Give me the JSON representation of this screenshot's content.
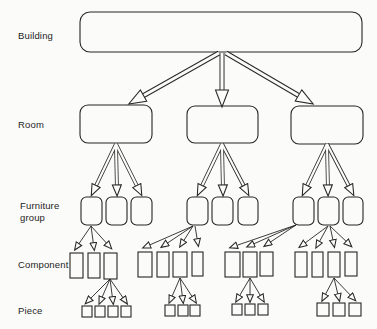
{
  "page": {
    "paper_color": "#fbfbf9",
    "ink_color": "#262626",
    "width": 377,
    "height": 329
  },
  "labels": {
    "building": "Building",
    "room": "Room",
    "furniture_group": "Furniture group",
    "component": "Component",
    "piece": "Piece"
  },
  "structure": {
    "levels": [
      "Building",
      "Room",
      "Furniture group",
      "Component",
      "Piece"
    ],
    "rooms_per_building": 3,
    "furniture_groups_per_room": 3,
    "component_groups": [
      {
        "parent": "furniture-box-1",
        "component_count": 3
      },
      {
        "parent": "furniture-box-4",
        "component_count": 4
      },
      {
        "parent": "furniture-box-7",
        "component_count": 3
      },
      {
        "parent": "furniture-box-8",
        "component_count": 4
      }
    ],
    "piece_groups": [
      {
        "parent": "component-box-1-3",
        "piece_count": 4
      },
      {
        "parent": "component-box-2-3",
        "piece_count": 3
      },
      {
        "parent": "component-box-3-2",
        "piece_count": 3
      },
      {
        "parent": "component-box-4-3",
        "piece_count": 3
      }
    ]
  },
  "diagram": {
    "boxes": [
      {
        "name": "building-box",
        "x": 80,
        "y": 12,
        "w": 282,
        "h": 40,
        "rx": 10
      },
      {
        "name": "room-box-1",
        "x": 80,
        "y": 105,
        "w": 72,
        "h": 38,
        "rx": 8
      },
      {
        "name": "room-box-2",
        "x": 187,
        "y": 106,
        "w": 71,
        "h": 37,
        "rx": 8
      },
      {
        "name": "room-box-3",
        "x": 291,
        "y": 106,
        "w": 72,
        "h": 38,
        "rx": 8
      },
      {
        "name": "furniture-box-1",
        "x": 81,
        "y": 197,
        "w": 21,
        "h": 28,
        "rx": 5.5
      },
      {
        "name": "furniture-box-2",
        "x": 106,
        "y": 197,
        "w": 21,
        "h": 28,
        "rx": 5.5
      },
      {
        "name": "furniture-box-3",
        "x": 131,
        "y": 197,
        "w": 21,
        "h": 28,
        "rx": 5.5
      },
      {
        "name": "furniture-box-4",
        "x": 187,
        "y": 197,
        "w": 21,
        "h": 28,
        "rx": 5.5
      },
      {
        "name": "furniture-box-5",
        "x": 212,
        "y": 197,
        "w": 21,
        "h": 28,
        "rx": 5.5
      },
      {
        "name": "furniture-box-6",
        "x": 238,
        "y": 197,
        "w": 20,
        "h": 28,
        "rx": 5.5
      },
      {
        "name": "furniture-box-7",
        "x": 293,
        "y": 197,
        "w": 21,
        "h": 28,
        "rx": 5.5
      },
      {
        "name": "furniture-box-8",
        "x": 318,
        "y": 197,
        "w": 21,
        "h": 28,
        "rx": 5.5
      },
      {
        "name": "furniture-box-9",
        "x": 343,
        "y": 197,
        "w": 20,
        "h": 28,
        "rx": 5.5
      },
      {
        "name": "component-box-1-1",
        "x": 70,
        "y": 253,
        "w": 13,
        "h": 25,
        "rx": 0
      },
      {
        "name": "component-box-1-2",
        "x": 88,
        "y": 253,
        "w": 12,
        "h": 25,
        "rx": 0
      },
      {
        "name": "component-box-1-3",
        "x": 104,
        "y": 253,
        "w": 13,
        "h": 26,
        "rx": 0
      },
      {
        "name": "component-box-2-1",
        "x": 138,
        "y": 252,
        "w": 14,
        "h": 25,
        "rx": 0
      },
      {
        "name": "component-box-2-2",
        "x": 157,
        "y": 252,
        "w": 12,
        "h": 25,
        "rx": 0
      },
      {
        "name": "component-box-2-3",
        "x": 173,
        "y": 252,
        "w": 14,
        "h": 25,
        "rx": 0
      },
      {
        "name": "component-box-2-4",
        "x": 192,
        "y": 252,
        "w": 11,
        "h": 24,
        "rx": 0
      },
      {
        "name": "component-box-3-1",
        "x": 225,
        "y": 252,
        "w": 15,
        "h": 25,
        "rx": 0
      },
      {
        "name": "component-box-3-2",
        "x": 243,
        "y": 252,
        "w": 14,
        "h": 25,
        "rx": 0
      },
      {
        "name": "component-box-3-3",
        "x": 260,
        "y": 252,
        "w": 13,
        "h": 24,
        "rx": 0
      },
      {
        "name": "component-box-4-1",
        "x": 295,
        "y": 252,
        "w": 12,
        "h": 25,
        "rx": 0
      },
      {
        "name": "component-box-4-2",
        "x": 312,
        "y": 252,
        "w": 11,
        "h": 25,
        "rx": 0
      },
      {
        "name": "component-box-4-3",
        "x": 328,
        "y": 252,
        "w": 12,
        "h": 25,
        "rx": 0
      },
      {
        "name": "component-box-4-4",
        "x": 345,
        "y": 252,
        "w": 12,
        "h": 24,
        "rx": 0
      },
      {
        "name": "piece-box-1-1",
        "x": 82,
        "y": 306,
        "w": 10,
        "h": 11,
        "rx": 0
      },
      {
        "name": "piece-box-1-2",
        "x": 95,
        "y": 306,
        "w": 10,
        "h": 11,
        "rx": 0
      },
      {
        "name": "piece-box-1-3",
        "x": 108,
        "y": 306,
        "w": 10,
        "h": 11,
        "rx": 0
      },
      {
        "name": "piece-box-1-4",
        "x": 121,
        "y": 306,
        "w": 10,
        "h": 11,
        "rx": 0
      },
      {
        "name": "piece-box-2-1",
        "x": 165,
        "y": 305,
        "w": 10,
        "h": 11,
        "rx": 0
      },
      {
        "name": "piece-box-2-2",
        "x": 178,
        "y": 305,
        "w": 10,
        "h": 11,
        "rx": 0
      },
      {
        "name": "piece-box-2-3",
        "x": 190,
        "y": 305,
        "w": 10,
        "h": 11,
        "rx": 0
      },
      {
        "name": "piece-box-3-1",
        "x": 232,
        "y": 304,
        "w": 10,
        "h": 11,
        "rx": 0
      },
      {
        "name": "piece-box-3-2",
        "x": 245,
        "y": 304,
        "w": 10,
        "h": 11,
        "rx": 0
      },
      {
        "name": "piece-box-3-3",
        "x": 258,
        "y": 304,
        "w": 10,
        "h": 11,
        "rx": 0
      },
      {
        "name": "piece-box-4-1",
        "x": 317,
        "y": 303,
        "w": 12,
        "h": 13,
        "rx": 0
      },
      {
        "name": "piece-box-4-2",
        "x": 333,
        "y": 303,
        "w": 12,
        "h": 13,
        "rx": 0
      },
      {
        "name": "piece-box-4-3",
        "x": 349,
        "y": 303,
        "w": 12,
        "h": 13,
        "rx": 0
      }
    ],
    "edges": [
      {
        "name": "edge-building-room1",
        "style": "trunk",
        "x1": 219,
        "y1": 53,
        "x2": 134,
        "y2": 101
      },
      {
        "name": "edge-building-room2",
        "style": "trunk",
        "x1": 222,
        "y1": 53,
        "x2": 222,
        "y2": 101
      },
      {
        "name": "edge-building-room3",
        "style": "trunk",
        "x1": 226,
        "y1": 53,
        "x2": 308,
        "y2": 101
      },
      {
        "name": "edge-room1-fg1",
        "style": "branch",
        "x1": 116,
        "y1": 144,
        "x2": 93,
        "y2": 192
      },
      {
        "name": "edge-room1-fg2",
        "style": "branch",
        "x1": 116,
        "y1": 144,
        "x2": 117,
        "y2": 192
      },
      {
        "name": "edge-room1-fg3",
        "style": "branch",
        "x1": 116,
        "y1": 144,
        "x2": 140,
        "y2": 192
      },
      {
        "name": "edge-room2-fg4",
        "style": "branch",
        "x1": 222,
        "y1": 144,
        "x2": 199,
        "y2": 192
      },
      {
        "name": "edge-room2-fg5",
        "style": "branch",
        "x1": 222,
        "y1": 144,
        "x2": 223,
        "y2": 192
      },
      {
        "name": "edge-room2-fg6",
        "style": "branch",
        "x1": 222,
        "y1": 144,
        "x2": 247,
        "y2": 192
      },
      {
        "name": "edge-room3-fg7",
        "style": "branch",
        "x1": 327,
        "y1": 144,
        "x2": 304,
        "y2": 192
      },
      {
        "name": "edge-room3-fg8",
        "style": "branch",
        "x1": 327,
        "y1": 144,
        "x2": 328,
        "y2": 192
      },
      {
        "name": "edge-room3-fg9",
        "style": "branch",
        "x1": 327,
        "y1": 144,
        "x2": 352,
        "y2": 192
      },
      {
        "name": "edge-fg1-c1",
        "style": "twig",
        "x1": 91,
        "y1": 226,
        "x2": 76,
        "y2": 248
      },
      {
        "name": "edge-fg1-c2",
        "style": "twig",
        "x1": 91,
        "y1": 226,
        "x2": 94,
        "y2": 248
      },
      {
        "name": "edge-fg1-c3",
        "style": "twig",
        "x1": 91,
        "y1": 226,
        "x2": 110,
        "y2": 247
      },
      {
        "name": "edge-fg4-c1",
        "style": "twig",
        "x1": 193,
        "y1": 226,
        "x2": 145,
        "y2": 247
      },
      {
        "name": "edge-fg4-c2",
        "style": "twig",
        "x1": 193,
        "y1": 226,
        "x2": 163,
        "y2": 246
      },
      {
        "name": "edge-fg4-c3",
        "style": "twig",
        "x1": 193,
        "y1": 226,
        "x2": 181,
        "y2": 245
      },
      {
        "name": "edge-fg4-c4",
        "style": "twig",
        "x1": 195,
        "y1": 226,
        "x2": 198,
        "y2": 244
      },
      {
        "name": "edge-fg7-c1",
        "style": "twig",
        "x1": 296,
        "y1": 225,
        "x2": 232,
        "y2": 247
      },
      {
        "name": "edge-fg7-c2",
        "style": "twig",
        "x1": 296,
        "y1": 225,
        "x2": 249,
        "y2": 246
      },
      {
        "name": "edge-fg7-c3",
        "style": "twig",
        "x1": 296,
        "y1": 225,
        "x2": 266,
        "y2": 245
      },
      {
        "name": "edge-fg8-c1",
        "style": "twig",
        "x1": 328,
        "y1": 226,
        "x2": 301,
        "y2": 246
      },
      {
        "name": "edge-fg8-c2",
        "style": "twig",
        "x1": 328,
        "y1": 226,
        "x2": 317,
        "y2": 246
      },
      {
        "name": "edge-fg8-c3",
        "style": "twig",
        "x1": 330,
        "y1": 226,
        "x2": 334,
        "y2": 245
      },
      {
        "name": "edge-fg8-c4",
        "style": "twig",
        "x1": 330,
        "y1": 226,
        "x2": 350,
        "y2": 245
      },
      {
        "name": "edge-c13-p1",
        "style": "twig",
        "x1": 110,
        "y1": 279,
        "x2": 87,
        "y2": 302
      },
      {
        "name": "edge-c13-p2",
        "style": "twig",
        "x1": 110,
        "y1": 279,
        "x2": 100,
        "y2": 302
      },
      {
        "name": "edge-c13-p3",
        "style": "twig",
        "x1": 110,
        "y1": 279,
        "x2": 113,
        "y2": 302
      },
      {
        "name": "edge-c13-p4",
        "style": "twig",
        "x1": 110,
        "y1": 279,
        "x2": 126,
        "y2": 302
      },
      {
        "name": "edge-c23-p1",
        "style": "twig",
        "x1": 180,
        "y1": 278,
        "x2": 170,
        "y2": 301
      },
      {
        "name": "edge-c23-p2",
        "style": "twig",
        "x1": 180,
        "y1": 278,
        "x2": 183,
        "y2": 301
      },
      {
        "name": "edge-c23-p3",
        "style": "twig",
        "x1": 180,
        "y1": 278,
        "x2": 195,
        "y2": 301
      },
      {
        "name": "edge-c32-p1",
        "style": "twig",
        "x1": 250,
        "y1": 278,
        "x2": 237,
        "y2": 300
      },
      {
        "name": "edge-c32-p2",
        "style": "twig",
        "x1": 250,
        "y1": 278,
        "x2": 250,
        "y2": 300
      },
      {
        "name": "edge-c32-p3",
        "style": "twig",
        "x1": 250,
        "y1": 278,
        "x2": 263,
        "y2": 300
      },
      {
        "name": "edge-c43-p1",
        "style": "twig",
        "x1": 334,
        "y1": 278,
        "x2": 323,
        "y2": 299
      },
      {
        "name": "edge-c43-p2",
        "style": "twig",
        "x1": 334,
        "y1": 278,
        "x2": 339,
        "y2": 299
      },
      {
        "name": "edge-c43-p3",
        "style": "twig",
        "x1": 334,
        "y1": 278,
        "x2": 354,
        "y2": 299
      }
    ]
  }
}
